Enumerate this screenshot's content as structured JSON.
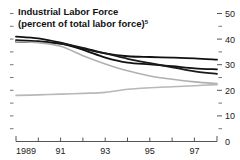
{
  "chart_data": {
    "type": "line",
    "title": "Industrial Labor Force",
    "subtitle": "(percent of total labor force)",
    "subtitle_superscript": "5",
    "xlabel": "",
    "ylabel": "",
    "xlim": [
      1989,
      1998
    ],
    "ylim": [
      0,
      50
    ],
    "grid": false,
    "legend": "none",
    "y_axis_position": "right",
    "y_ticks": [
      0,
      10,
      20,
      30,
      40,
      50
    ],
    "y_tick_labels": [
      "0",
      "10",
      "20",
      "30",
      "40",
      "50"
    ],
    "y_minor_ticks": [
      5,
      15,
      25,
      35,
      45
    ],
    "x_ticks": [
      1989,
      1990,
      1991,
      1992,
      1993,
      1994,
      1995,
      1996,
      1997,
      1998
    ],
    "x_tick_labels": [
      "1989",
      "",
      "91",
      "",
      "93",
      "",
      "95",
      "",
      "97",
      ""
    ],
    "x": [
      1989,
      1990,
      1991,
      1992,
      1993,
      1994,
      1995,
      1996,
      1997,
      1998
    ],
    "series": [
      {
        "name": "series-1-dark-upper",
        "color": "#111111",
        "width": 1.8,
        "values": [
          41.0,
          40.3,
          38.6,
          36.3,
          34.4,
          33.3,
          33.0,
          32.8,
          32.5,
          32.0
        ]
      },
      {
        "name": "series-2-dark-middle",
        "color": "#111111",
        "width": 1.8,
        "values": [
          39.6,
          39.2,
          38.2,
          35.8,
          32.8,
          30.8,
          30.1,
          29.4,
          28.6,
          28.2
        ]
      },
      {
        "name": "series-3-dark-lower",
        "color": "#1a1a1a",
        "width": 1.8,
        "values": [
          39.0,
          38.8,
          38.2,
          36.6,
          34.4,
          32.3,
          30.6,
          29.0,
          27.4,
          26.4
        ]
      },
      {
        "name": "series-4-gray-declining",
        "color": "#b0b0b0",
        "width": 1.6,
        "values": [
          39.0,
          38.6,
          37.2,
          33.5,
          30.3,
          27.6,
          25.6,
          24.3,
          23.3,
          22.6
        ]
      },
      {
        "name": "series-5-gray-rising",
        "color": "#b8b8b8",
        "width": 1.6,
        "values": [
          18.0,
          18.2,
          18.5,
          18.8,
          19.2,
          20.4,
          21.0,
          21.4,
          21.8,
          22.2
        ]
      }
    ]
  },
  "labels": {
    "title": "Industrial Labor Force",
    "subtitle": "(percent of total labor force)",
    "subtitle_sup": "5",
    "y_50": "50",
    "y_40": "40",
    "y_30": "30",
    "y_20": "20",
    "y_10": "10",
    "y_0": "0",
    "x_1989": "1989",
    "x_91": "91",
    "x_93": "93",
    "x_95": "95",
    "x_97": "97"
  }
}
